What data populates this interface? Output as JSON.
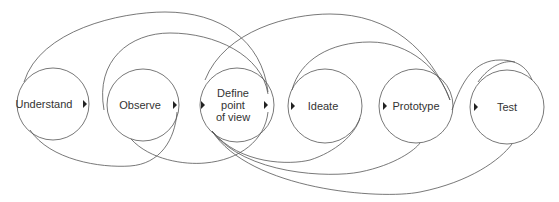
{
  "diagram": {
    "stages": [
      {
        "label": "Understand",
        "cx": 53,
        "cy": 104,
        "r": 36,
        "lx": 44
      },
      {
        "label": "Observe",
        "cx": 143,
        "cy": 105,
        "r": 36,
        "lx": 140
      },
      {
        "label": "Define point of view",
        "lines": [
          "Define",
          "point",
          "of view"
        ],
        "cx": 237,
        "cy": 105,
        "r": 37,
        "lx": 233
      },
      {
        "label": "Ideate",
        "cx": 325,
        "cy": 106,
        "r": 37,
        "lx": 323
      },
      {
        "label": "Prototype",
        "cx": 416,
        "cy": 106,
        "r": 37,
        "lx": 416
      },
      {
        "label": "Test",
        "cx": 507,
        "cy": 107,
        "r": 37,
        "lx": 507
      }
    ],
    "arrows": [
      {
        "x": 83,
        "y": 104,
        "dir": "right"
      },
      {
        "x": 174,
        "y": 105,
        "dir": "right"
      },
      {
        "x": 201,
        "y": 105,
        "dir": "right"
      },
      {
        "x": 264,
        "y": 105,
        "dir": "right"
      },
      {
        "x": 291,
        "y": 106,
        "dir": "right"
      },
      {
        "x": 383,
        "y": 106,
        "dir": "right"
      },
      {
        "x": 475,
        "y": 107,
        "dir": "right"
      }
    ],
    "stroke_color": "#555555",
    "text_color": "#333333"
  }
}
